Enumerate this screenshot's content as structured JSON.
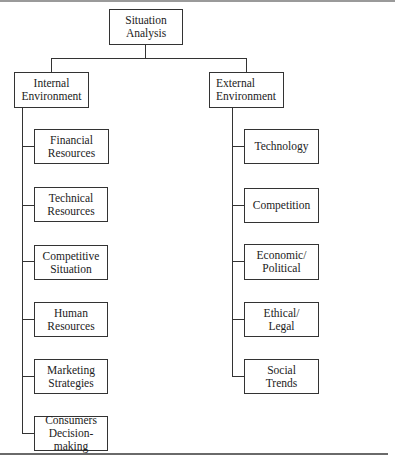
{
  "diagram": {
    "root": {
      "label": "Situation\nAnalysis"
    },
    "branches": [
      {
        "label": "Internal\nEnvironment",
        "children": [
          "Financial\nResources",
          "Technical\nResources",
          "Competitive\nSituation",
          "Human\nResources",
          "Marketing\nStrategies",
          "Consumers\nDecision-making"
        ]
      },
      {
        "label": "External\nEnvironment",
        "children": [
          "Technology",
          "Competition",
          "Economic/\nPolitical",
          "Ethical/\nLegal",
          "Social\nTrends"
        ]
      }
    ]
  }
}
